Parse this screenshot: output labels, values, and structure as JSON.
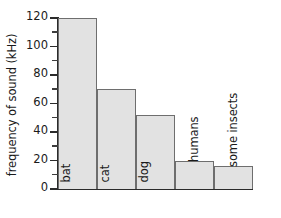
{
  "chart_data": {
    "type": "bar",
    "title": "",
    "xlabel": "",
    "ylabel": "frequency of sound (kHz)",
    "categories": [
      "bat",
      "cat",
      "dog",
      "humans",
      "some insects"
    ],
    "values": [
      120,
      70,
      52,
      20,
      16
    ],
    "ylim": [
      0,
      120
    ],
    "yticks": [
      0,
      20,
      40,
      60,
      80,
      100,
      120
    ],
    "ytick_labels": [
      "0",
      "20",
      "40",
      "60",
      "80",
      "100",
      "120"
    ],
    "yticks_minor": [
      10,
      30,
      50,
      70,
      90,
      110
    ],
    "grid": false,
    "legend": null,
    "bar_fill_color": "#e2e2e2",
    "bar_edge_color": "#6e6e6e",
    "axis_color": "#2b2b2b",
    "background_color": "#ffffff",
    "label_placement": [
      "inside",
      "inside",
      "inside",
      "outside",
      "outside"
    ]
  }
}
